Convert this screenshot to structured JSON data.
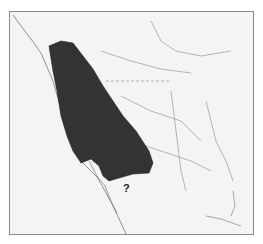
{
  "map": {
    "type": "range map",
    "region": "Western North America",
    "range_color": "#333333",
    "land_color": "#f4f4f4",
    "line_color": "#777777",
    "annotation": "?"
  }
}
